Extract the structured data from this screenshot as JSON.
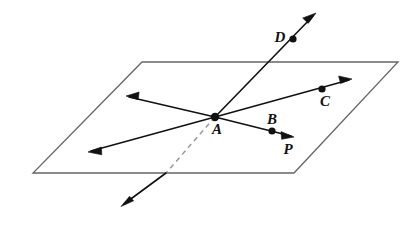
{
  "figure": {
    "background_color": "#ffffff",
    "plane_stroke_color": "#666666",
    "ray_stroke_color": "#111111",
    "dashed_stroke_color": "#999999",
    "label_color": "#111111",
    "width": 409,
    "height": 226
  },
  "plane": {
    "name": "plane-P",
    "label": "P",
    "label_x": 288,
    "label_y": 154,
    "corners": [
      {
        "name": "top-left",
        "x": 142,
        "y": 62
      },
      {
        "name": "top-right",
        "x": 398,
        "y": 62
      },
      {
        "name": "bottom-right",
        "x": 294,
        "y": 173
      },
      {
        "name": "bottom-left",
        "x": 33,
        "y": 173
      }
    ]
  },
  "points": [
    {
      "id": "A",
      "label": "A",
      "x": 215,
      "y": 117,
      "label_x": 217,
      "label_y": 134,
      "dot_r": 4.2,
      "in_plane": true
    },
    {
      "id": "B",
      "label": "B",
      "x": 272,
      "y": 131,
      "label_x": 272,
      "label_y": 124,
      "dot_r": 3.6,
      "in_plane": true
    },
    {
      "id": "C",
      "label": "C",
      "x": 322,
      "y": 89,
      "label_x": 325,
      "label_y": 106,
      "dot_r": 3.6,
      "in_plane": true
    },
    {
      "id": "D",
      "label": "D",
      "x": 293,
      "y": 39,
      "label_x": 280,
      "label_y": 42,
      "dot_r": 3.6,
      "in_plane": false
    }
  ],
  "rays": [
    {
      "name": "ray-AC",
      "from": "A",
      "through": "C",
      "x1": 215,
      "y1": 117,
      "x2": 352,
      "y2": 79,
      "dashed": false,
      "arrow_start": false,
      "arrow_end": true
    },
    {
      "name": "ray-AB",
      "from": "A",
      "through": "B",
      "x1": 215,
      "y1": 117,
      "x2": 294,
      "y2": 137,
      "dashed": false,
      "arrow_start": false,
      "arrow_end": true
    },
    {
      "name": "ray-A-upper-left",
      "from": "A",
      "through": "",
      "x1": 215,
      "y1": 117,
      "x2": 126,
      "y2": 96,
      "dashed": false,
      "arrow_start": false,
      "arrow_end": true
    },
    {
      "name": "ray-A-lower-left",
      "from": "A",
      "through": "",
      "x1": 215,
      "y1": 117,
      "x2": 88,
      "y2": 152,
      "dashed": false,
      "arrow_start": false,
      "arrow_end": true
    }
  ],
  "line_AD": {
    "name": "line-AD",
    "upper_segment": {
      "x1": 215,
      "y1": 117,
      "x2": 316,
      "y2": 13,
      "arrow_end": true,
      "dashed": false
    },
    "hidden_segment": {
      "x1": 215,
      "y1": 117,
      "x2": 166,
      "y2": 173,
      "dashed": true,
      "note": "behind plane"
    },
    "lower_segment": {
      "x1": 166,
      "y1": 173,
      "x2": 121,
      "y2": 206,
      "arrow_end": true,
      "dashed": false
    }
  },
  "arrowhead": {
    "length": 11,
    "half_width": 4.2
  }
}
